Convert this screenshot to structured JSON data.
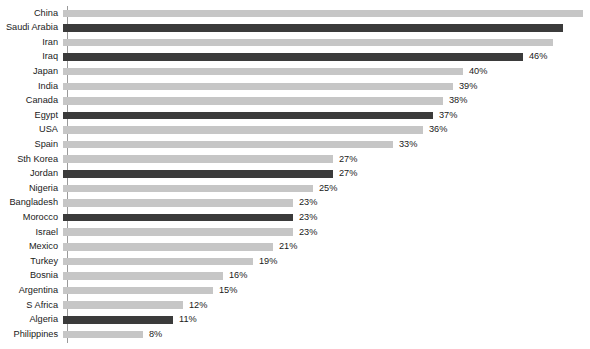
{
  "chart_data": {
    "type": "bar",
    "orientation": "horizontal",
    "title": "",
    "subtitle": "",
    "xlabel": "",
    "ylabel": "",
    "grid": false,
    "legend": null,
    "axis": {
      "baseline_visible": true,
      "tick_labels": [],
      "xlim": [
        0,
        52
      ],
      "value_suffix": "%"
    },
    "colors": {
      "bar_default": "#c6c6c6",
      "bar_highlight": "#3b3b3b",
      "text": "#1a1a1a",
      "axis_line": "#9a9a9a",
      "background": "#ffffff"
    },
    "categories": [
      "China",
      "Saudi Arabia",
      "Iran",
      "Iraq",
      "Japan",
      "India",
      "Canada",
      "Egypt",
      "USA",
      "Spain",
      "Sth Korea",
      "Jordan",
      "Nigeria",
      "Bangladesh",
      "Morocco",
      "Israel",
      "Mexico",
      "Turkey",
      "Bosnia",
      "Argentina",
      "S Africa",
      "Algeria",
      "Philippines"
    ],
    "values": [
      52,
      50,
      49,
      46,
      40,
      39,
      38,
      37,
      36,
      33,
      27,
      27,
      25,
      23,
      23,
      23,
      21,
      19,
      16,
      15,
      12,
      11,
      8
    ],
    "value_labels": [
      "",
      "",
      "",
      "46%",
      "40%",
      "39%",
      "38%",
      "37%",
      "36%",
      "33%",
      "27%",
      "27%",
      "25%",
      "23%",
      "23%",
      "23%",
      "21%",
      "19%",
      "16%",
      "15%",
      "12%",
      "11%",
      "8%"
    ],
    "highlighted": [
      false,
      true,
      false,
      true,
      false,
      false,
      false,
      true,
      false,
      false,
      false,
      true,
      false,
      false,
      true,
      false,
      false,
      false,
      false,
      false,
      false,
      true,
      false
    ],
    "bars": [
      {
        "category": "China",
        "value": 52,
        "label": "",
        "highlight": false
      },
      {
        "category": "Saudi Arabia",
        "value": 50,
        "label": "",
        "highlight": true
      },
      {
        "category": "Iran",
        "value": 49,
        "label": "",
        "highlight": false
      },
      {
        "category": "Iraq",
        "value": 46,
        "label": "46%",
        "highlight": true
      },
      {
        "category": "Japan",
        "value": 40,
        "label": "40%",
        "highlight": false
      },
      {
        "category": "India",
        "value": 39,
        "label": "39%",
        "highlight": false
      },
      {
        "category": "Canada",
        "value": 38,
        "label": "38%",
        "highlight": false
      },
      {
        "category": "Egypt",
        "value": 37,
        "label": "37%",
        "highlight": true
      },
      {
        "category": "USA",
        "value": 36,
        "label": "36%",
        "highlight": false
      },
      {
        "category": "Spain",
        "value": 33,
        "label": "33%",
        "highlight": false
      },
      {
        "category": "Sth Korea",
        "value": 27,
        "label": "27%",
        "highlight": false
      },
      {
        "category": "Jordan",
        "value": 27,
        "label": "27%",
        "highlight": true
      },
      {
        "category": "Nigeria",
        "value": 25,
        "label": "25%",
        "highlight": false
      },
      {
        "category": "Bangladesh",
        "value": 23,
        "label": "23%",
        "highlight": false
      },
      {
        "category": "Morocco",
        "value": 23,
        "label": "23%",
        "highlight": true
      },
      {
        "category": "Israel",
        "value": 23,
        "label": "23%",
        "highlight": false
      },
      {
        "category": "Mexico",
        "value": 21,
        "label": "21%",
        "highlight": false
      },
      {
        "category": "Turkey",
        "value": 19,
        "label": "19%",
        "highlight": false
      },
      {
        "category": "Bosnia",
        "value": 16,
        "label": "16%",
        "highlight": false
      },
      {
        "category": "Argentina",
        "value": 15,
        "label": "15%",
        "highlight": false
      },
      {
        "category": "S Africa",
        "value": 12,
        "label": "12%",
        "highlight": false
      },
      {
        "category": "Algeria",
        "value": 11,
        "label": "11%",
        "highlight": true
      },
      {
        "category": "Philippines",
        "value": 8,
        "label": "8%",
        "highlight": false
      }
    ]
  }
}
